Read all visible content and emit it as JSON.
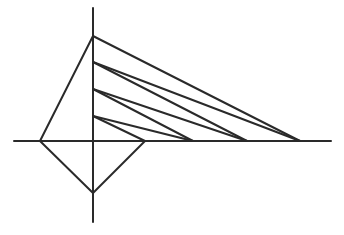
{
  "diagram": {
    "stroke_color": "#2a2a2a",
    "background": "#ffffff",
    "axes": {
      "horizontal": {
        "x1": 14,
        "y1": 141,
        "x2": 331,
        "y2": 141
      },
      "vertical": {
        "x1": 93,
        "y1": 8,
        "x2": 93,
        "y2": 222
      }
    },
    "quad": [
      {
        "x1": 93,
        "y1": 36,
        "x2": 40,
        "y2": 141
      },
      {
        "x1": 40,
        "y1": 141,
        "x2": 93,
        "y2": 193
      },
      {
        "x1": 93,
        "y1": 193,
        "x2": 145,
        "y2": 141
      }
    ],
    "rays": [
      {
        "x1": 93,
        "y1": 36,
        "x2": 300,
        "y2": 141
      },
      {
        "x1": 93,
        "y1": 62,
        "x2": 300,
        "y2": 141
      },
      {
        "x1": 93,
        "y1": 62,
        "x2": 247,
        "y2": 141
      },
      {
        "x1": 93,
        "y1": 89,
        "x2": 247,
        "y2": 141
      },
      {
        "x1": 93,
        "y1": 89,
        "x2": 193,
        "y2": 141
      },
      {
        "x1": 93,
        "y1": 116,
        "x2": 193,
        "y2": 141
      },
      {
        "x1": 93,
        "y1": 116,
        "x2": 145,
        "y2": 141
      }
    ]
  }
}
